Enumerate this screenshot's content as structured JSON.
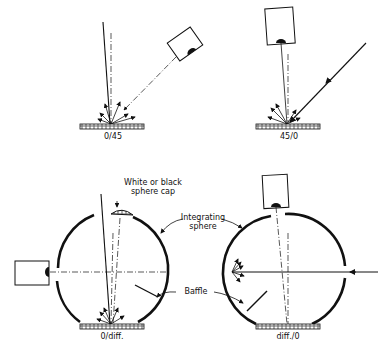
{
  "diagram": {
    "type": "measurement-geometries",
    "panels": [
      {
        "id": "0/45",
        "label": "0/45",
        "description": "Illumination at 0°, viewing at 45°"
      },
      {
        "id": "45/0",
        "label": "45/0",
        "description": "Illumination at 45°, viewing at 0°"
      },
      {
        "id": "0/diff",
        "label": "0/diff.",
        "description": "Illumination at 0°, diffuse viewing with integrating sphere"
      },
      {
        "id": "diff/0",
        "label": "diff./0",
        "description": "Diffuse illumination with integrating sphere, viewing at 0°"
      }
    ],
    "annotations": {
      "sphere_cap": [
        "White or black",
        "sphere cap"
      ],
      "integrating_sphere": [
        "Integrating",
        "sphere"
      ],
      "baffle": "Baffle"
    },
    "colors": {
      "line": "#111111",
      "background": "#ffffff"
    }
  }
}
